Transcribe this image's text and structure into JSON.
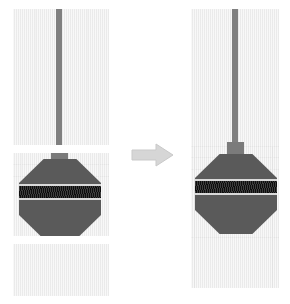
{
  "figure": {
    "type": "before-after-diagram",
    "caption": "",
    "background_color": "#ffffff"
  },
  "colors": {
    "tile_paper": "#f0f0f0",
    "guide_line": "#e2e2e2",
    "stem": "#808080",
    "neck": "#7b7b7b",
    "octagon_body": "#5a5a5a",
    "band_dark": "#121212",
    "band_edge": "#d9d9d9",
    "arrow": "#d6d6d6",
    "arrow_outline": "#c4c4c4",
    "seam_gap": "#ffffff"
  },
  "left_panel": {
    "name": "unmerged-tiles",
    "label": "",
    "tiles": [
      {
        "id": "tile-top",
        "label": "",
        "content": "vertical-stem"
      },
      {
        "id": "tile-middle",
        "label": "",
        "content": "octagon-with-striped-band"
      },
      {
        "id": "tile-bottom",
        "label": "",
        "content": "empty"
      }
    ],
    "seam_count": 2
  },
  "right_panel": {
    "name": "merged-panel",
    "label": "",
    "tiles": [
      {
        "id": "merged-tile",
        "label": "",
        "content": "stem-and-octagon-continuous"
      }
    ],
    "seam_count": 0
  },
  "arrow": {
    "name": "transform-arrow",
    "direction": "right",
    "label": ""
  },
  "object": {
    "name": "octagon-balloon-shape",
    "parts": [
      {
        "id": "stem",
        "label": ""
      },
      {
        "id": "neck",
        "label": ""
      },
      {
        "id": "octagon",
        "label": ""
      },
      {
        "id": "band",
        "label": ""
      }
    ]
  }
}
